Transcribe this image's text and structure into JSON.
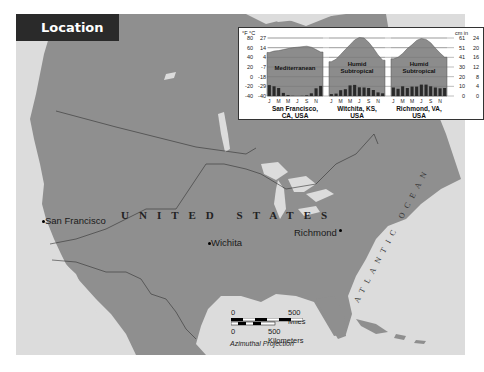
{
  "header": {
    "title": "Location"
  },
  "map": {
    "country_label": "UNITED STATES",
    "oceans": [
      {
        "name": "PACIFIC OCEAN"
      },
      {
        "name": "ATLANTIC OCEAN"
      }
    ],
    "cities": [
      {
        "name": "San Francisco"
      },
      {
        "name": "Wichita"
      },
      {
        "name": "Richmond"
      }
    ],
    "scale_bar": {
      "miles_zero": "0",
      "miles_label": "500 Miles",
      "km_zero": "0",
      "km_label": "500 Kilometers"
    },
    "projection": "Azimuthal Projection"
  },
  "chart_data": {
    "type": "climograph",
    "left_axis": {
      "units": [
        "°F",
        "°C"
      ],
      "ticks": [
        {
          "f": "80",
          "c": "27"
        },
        {
          "f": "60",
          "c": "14"
        },
        {
          "f": "40",
          "c": "4"
        },
        {
          "f": "20",
          "c": "-7"
        },
        {
          "f": "0",
          "c": "-18"
        },
        {
          "f": "-20",
          "c": "-29"
        },
        {
          "f": "-40",
          "c": "-40"
        }
      ]
    },
    "right_axis": {
      "units": [
        "cm",
        "in"
      ],
      "ticks": [
        {
          "cm": "61",
          "in": "24"
        },
        {
          "cm": "51",
          "in": "20"
        },
        {
          "cm": "41",
          "in": "16"
        },
        {
          "cm": "30",
          "in": "12"
        },
        {
          "cm": "20",
          "in": "8"
        },
        {
          "cm": "10",
          "in": "4"
        },
        {
          "cm": "0",
          "in": "0"
        }
      ]
    },
    "month_ticks": [
      "J",
      "M",
      "M",
      "J",
      "S",
      "N"
    ],
    "series": [
      {
        "name": "San Francisco, CA, USA",
        "label_line1": "San Francisco,",
        "label_line2": "CA, USA",
        "climate": "Mediterranean",
        "climate_line1": "Mediterranean",
        "climate_line2": "",
        "temperature_f": [
          50,
          53,
          54,
          56,
          58,
          60,
          61,
          62,
          63,
          61,
          56,
          51
        ],
        "precipitation_in": [
          4.5,
          4.0,
          3.3,
          1.3,
          0.4,
          0.1,
          0.0,
          0.1,
          0.3,
          1.1,
          3.2,
          4.2
        ]
      },
      {
        "name": "Witchita, KS, USA",
        "label_line1": "Witchita, KS,",
        "label_line2": "USA",
        "climate": "Humid Subtropical",
        "climate_line1": "Humid",
        "climate_line2": "Subtropical",
        "temperature_f": [
          31,
          36,
          46,
          56,
          66,
          76,
          81,
          80,
          71,
          59,
          45,
          34
        ],
        "precipitation_in": [
          0.8,
          1.0,
          2.4,
          2.8,
          4.4,
          4.6,
          3.6,
          3.5,
          3.3,
          2.5,
          1.5,
          1.1
        ]
      },
      {
        "name": "Richmond, VA, USA",
        "label_line1": "Richmond, VA,",
        "label_line2": "USA",
        "climate": "Humid Subtropical",
        "climate_line1": "Humid",
        "climate_line2": "Subtropical",
        "temperature_f": [
          37,
          40,
          48,
          58,
          66,
          75,
          79,
          77,
          70,
          59,
          49,
          40
        ],
        "precipitation_in": [
          3.5,
          3.0,
          4.0,
          3.3,
          3.9,
          3.9,
          4.7,
          4.7,
          4.0,
          3.5,
          3.2,
          3.3
        ]
      }
    ],
    "ylim_temp_f": [
      -40,
      80
    ],
    "ylim_precip_in": [
      0,
      24
    ]
  }
}
